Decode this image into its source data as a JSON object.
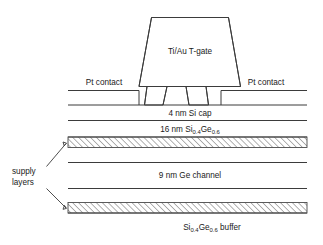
{
  "diagram": {
    "colors": {
      "stroke": "#3b3b3b",
      "background": "#ffffff",
      "hatch": "#4a4a4a",
      "text": "#1a1a1a"
    },
    "gate": {
      "label": "Ti/Au T-gate"
    },
    "contacts": {
      "left_label": "Pt contact",
      "right_label": "Pt contact"
    },
    "annotation": {
      "supply_line1": "supply",
      "supply_line2": "layers"
    },
    "layers": [
      {
        "name": "si-cap",
        "label": "4 nm Si cap",
        "thickness_nm": 4,
        "material": "Si",
        "hatched": false
      },
      {
        "name": "sige-barrier",
        "label_prefix": "16 nm Si",
        "label_sub1": "0.4",
        "label_mid": "Ge",
        "label_sub2": "0.6",
        "thickness_nm": 16,
        "material": "Si0.4Ge0.6",
        "hatched": false
      },
      {
        "name": "upper-supply-layer",
        "label": "",
        "material": "supply layer",
        "hatched": true
      },
      {
        "name": "ge-channel",
        "label": "9 nm Ge channel",
        "thickness_nm": 9,
        "material": "Ge",
        "hatched": false
      },
      {
        "name": "lower-supply-layer",
        "label": "",
        "material": "supply layer",
        "hatched": true
      },
      {
        "name": "sige-buffer",
        "label_prefix": "Si",
        "label_sub1": "0.4",
        "label_mid": "Ge",
        "label_sub2": "0.6",
        "label_suffix": " buffer",
        "material": "Si0.4Ge0.6",
        "hatched": false
      }
    ]
  }
}
